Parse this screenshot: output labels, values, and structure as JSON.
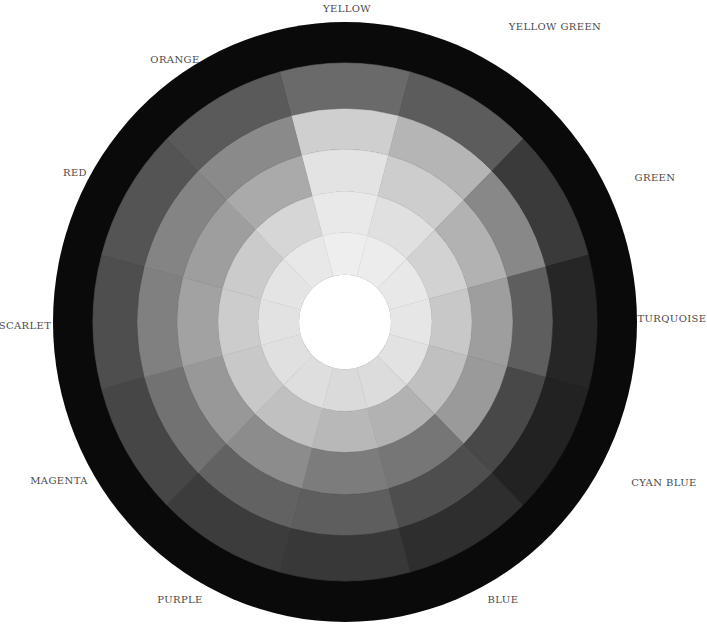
{
  "chart_data": {
    "type": "heatmap",
    "subtype": "radial-value-wheel",
    "title": "",
    "geometry": {
      "center": [
        345,
        322
      ],
      "rx": 292,
      "ry": 300,
      "center_radius": 46,
      "ring_radii": [
        46,
        87,
        127,
        168,
        208,
        252
      ],
      "outer_band_color": "#0a0a0a",
      "center_color": "#ffffff"
    },
    "sectors": [
      {
        "label": "YELLOW",
        "angle": 90,
        "values": [
          "#eeeeee",
          "#e9e9e9",
          "#e3e3e3",
          "#cfcfcf",
          "#6a6a6a"
        ]
      },
      {
        "label": "YELLOW GREEN",
        "angle": 60,
        "values": [
          "#ececec",
          "#e0e0e0",
          "#cdcdcd",
          "#b5b5b5",
          "#5c5c5c"
        ]
      },
      {
        "label": "GREEN",
        "angle": 30,
        "values": [
          "#e8e8e8",
          "#d2d2d2",
          "#b2b2b2",
          "#888888",
          "#3a3a3a"
        ]
      },
      {
        "label": "TURQUOISE",
        "angle": 0,
        "values": [
          "#e6e6e6",
          "#c8c8c8",
          "#9e9e9e",
          "#5e5e5e",
          "#262626"
        ]
      },
      {
        "label": "CYAN BLUE",
        "angle": -30,
        "values": [
          "#e2e2e2",
          "#c0c0c0",
          "#9a9a9a",
          "#484848",
          "#222222"
        ]
      },
      {
        "label": "BLUE",
        "angle": -60,
        "values": [
          "#dcdcdc",
          "#b2b2b2",
          "#767676",
          "#4e4e4e",
          "#2e2e2e"
        ]
      },
      {
        "label": "",
        "angle": -90,
        "values": [
          "#dadada",
          "#b8b8b8",
          "#7c7c7c",
          "#5e5e5e",
          "#383838"
        ]
      },
      {
        "label": "PURPLE",
        "angle": -120,
        "values": [
          "#dedede",
          "#c0c0c0",
          "#8c8c8c",
          "#626262",
          "#3c3c3c"
        ]
      },
      {
        "label": "MAGENTA",
        "angle": -150,
        "values": [
          "#e0e0e0",
          "#c8c8c8",
          "#989898",
          "#727272",
          "#464646"
        ]
      },
      {
        "label": "SCARLET",
        "angle": 180,
        "values": [
          "#e2e2e2",
          "#cccccc",
          "#a2a2a2",
          "#808080",
          "#4e4e4e"
        ]
      },
      {
        "label": "RED",
        "angle": 150,
        "values": [
          "#e4e4e4",
          "#cbcbcb",
          "#9e9e9e",
          "#848484",
          "#545454"
        ]
      },
      {
        "label": "ORANGE",
        "angle": 120,
        "values": [
          "#e8e8e8",
          "#d6d6d6",
          "#aaaaaa",
          "#8a8a8a",
          "#5a5a5a"
        ]
      }
    ]
  },
  "labels": [
    {
      "text": "YELLOW",
      "x": 347,
      "y": 8
    },
    {
      "text": "YELLOW GREEN",
      "x": 555,
      "y": 26
    },
    {
      "text": "ORANGE",
      "x": 175,
      "y": 59
    },
    {
      "text": "RED",
      "x": 75,
      "y": 172
    },
    {
      "text": "GREEN",
      "x": 655,
      "y": 177
    },
    {
      "text": "SCARLET",
      "x": 25,
      "y": 325
    },
    {
      "text": "TURQUOISE",
      "x": 672,
      "y": 318
    },
    {
      "text": "MAGENTA",
      "x": 59,
      "y": 480
    },
    {
      "text": "CYAN BLUE",
      "x": 664,
      "y": 482
    },
    {
      "text": "PURPLE",
      "x": 180,
      "y": 599
    },
    {
      "text": "BLUE",
      "x": 503,
      "y": 599
    }
  ]
}
